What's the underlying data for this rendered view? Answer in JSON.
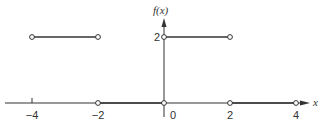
{
  "chart_data": {
    "type": "line",
    "title": "",
    "xlabel": "x",
    "ylabel": "f(x)",
    "xlim": [
      -4.4,
      4.5
    ],
    "ylim": [
      -0.5,
      2.8
    ],
    "grid": false,
    "legend": "none",
    "x_ticks": [
      {
        "value": -4,
        "label": "−4"
      },
      {
        "value": -2,
        "label": "−2"
      },
      {
        "value": 0,
        "label": "0"
      },
      {
        "value": 2,
        "label": "2"
      },
      {
        "value": 4,
        "label": "4"
      }
    ],
    "y_ticks": [
      {
        "value": 2,
        "label": "2"
      }
    ],
    "segments": [
      {
        "x": [
          -4,
          -2
        ],
        "y": [
          2,
          2
        ],
        "open_start": true,
        "open_end": true
      },
      {
        "x": [
          -2,
          0
        ],
        "y": [
          0,
          0
        ],
        "open_start": true,
        "open_end": true
      },
      {
        "x": [
          0,
          2
        ],
        "y": [
          2,
          2
        ],
        "open_start": true,
        "open_end": true
      },
      {
        "x": [
          2,
          4
        ],
        "y": [
          0,
          0
        ],
        "open_start": true,
        "open_end": true
      }
    ],
    "colors": {
      "line": "#333333",
      "axis": "#333333",
      "point_fill": "#ffffff"
    }
  }
}
